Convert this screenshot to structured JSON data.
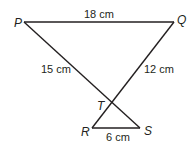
{
  "diagram": {
    "type": "geometry-figure",
    "points": {
      "P": {
        "label": "P",
        "x": 24,
        "y": 22
      },
      "Q": {
        "label": "Q",
        "x": 174,
        "y": 22
      },
      "T": {
        "label": "T",
        "x": 113,
        "y": 103
      },
      "R": {
        "label": "R",
        "x": 92,
        "y": 128
      },
      "S": {
        "label": "S",
        "x": 140,
        "y": 128
      }
    },
    "segments": [
      {
        "from": "P",
        "to": "Q",
        "label": "18 cm"
      },
      {
        "from": "P",
        "to": "S",
        "label": "15 cm",
        "label_refers_to": "PT"
      },
      {
        "from": "Q",
        "to": "R",
        "label": "12 cm",
        "label_refers_to": "QT"
      },
      {
        "from": "R",
        "to": "S",
        "label": "6 cm"
      }
    ],
    "labels": {
      "P": "P",
      "Q": "Q",
      "T": "T",
      "R": "R",
      "S": "S",
      "PQ": "18 cm",
      "PT": "15 cm",
      "QT": "12 cm",
      "RS": "6 cm"
    },
    "colors": {
      "line": "#231f20",
      "text": "#231f20",
      "background": "#ffffff"
    }
  }
}
